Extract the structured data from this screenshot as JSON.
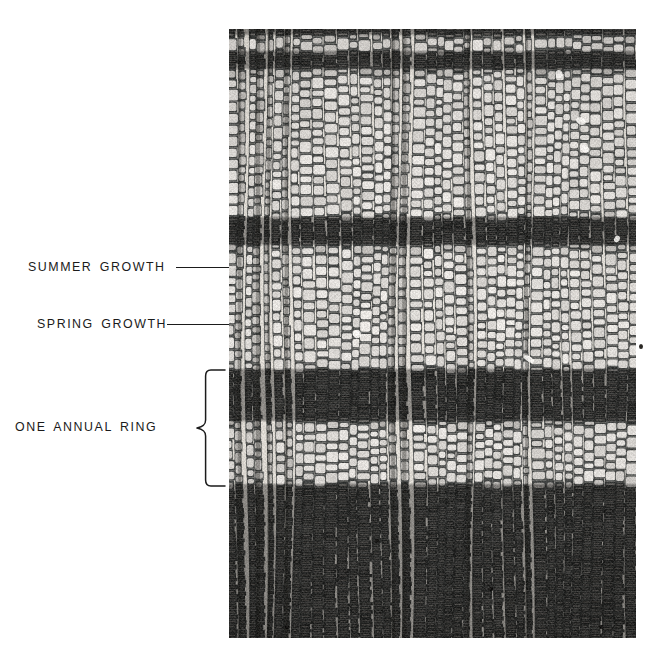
{
  "figure": {
    "background_color": "#ffffff",
    "ink_color": "#1b1b1b"
  },
  "annotations": [
    {
      "id": "summer-growth",
      "label": "SUMMER GROWTH",
      "leader": "line",
      "points_to": "dense dark latewood band"
    },
    {
      "id": "spring-growth",
      "label": "SPRING GROWTH",
      "leader": "line",
      "points_to": "open light earlywood band"
    },
    {
      "id": "one-annual-ring",
      "label": "ONE ANNUAL RING",
      "leader": "brace",
      "points_to": "one complete springwood-plus-summerwood cycle"
    }
  ],
  "labels": {
    "summer_growth": "SUMMER GROWTH",
    "spring_growth": "SPRING GROWTH",
    "one_annual_ring": "ONE ANNUAL RING"
  },
  "micrograph": {
    "subject": "softwood transverse section",
    "cell_type": "tracheids in radial files",
    "left": 229,
    "top": 29,
    "width": 407,
    "height": 609,
    "tone_light": "#ddd9d2",
    "tone_mid": "#8e8a84",
    "tone_dark": "#201e1c",
    "bands": [
      {
        "type": "latewood",
        "y_start": 0,
        "y_end": 6,
        "label": "summer growth"
      },
      {
        "type": "earlywood",
        "y_start": 6,
        "y_end": 22,
        "label": "spring growth"
      },
      {
        "type": "latewood",
        "y_start": 22,
        "y_end": 40,
        "label": "summer growth"
      },
      {
        "type": "earlywood",
        "y_start": 40,
        "y_end": 188,
        "label": "spring growth"
      },
      {
        "type": "latewood",
        "y_start": 188,
        "y_end": 216,
        "label": "summer growth"
      },
      {
        "type": "earlywood",
        "y_start": 216,
        "y_end": 340,
        "label": "spring growth"
      },
      {
        "type": "latewood",
        "y_start": 340,
        "y_end": 392,
        "label": "summer growth"
      },
      {
        "type": "earlywood",
        "y_start": 392,
        "y_end": 455,
        "label": "spring growth"
      },
      {
        "type": "latewood",
        "y_start": 455,
        "y_end": 609,
        "label": "summer growth"
      }
    ],
    "annual_ring_bracket": {
      "top": 368,
      "bottom": 488
    }
  }
}
